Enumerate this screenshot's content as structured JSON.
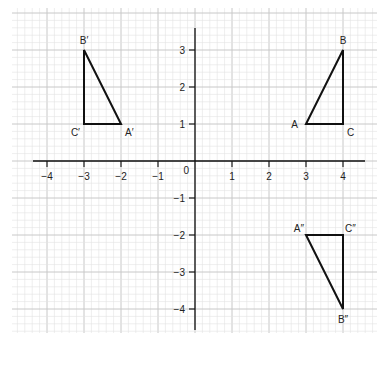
{
  "diagram": {
    "type": "coordinate-grid-transformations",
    "axes": {
      "x_range": [
        -4,
        4
      ],
      "y_range": [
        -4,
        3
      ],
      "x_tick_labels": [
        "−4",
        "−3",
        "−2",
        "−1",
        "1",
        "2",
        "3",
        "4"
      ],
      "x_tick_values": [
        -4,
        -3,
        -2,
        -1,
        1,
        2,
        3,
        4
      ],
      "y_tick_labels": [
        "3",
        "2",
        "1",
        "−1",
        "−2",
        "−3",
        "−4"
      ],
      "y_tick_values": [
        3,
        2,
        1,
        -1,
        -2,
        -3,
        -4
      ],
      "origin_label": "0",
      "grid_minor_per_unit": 5
    },
    "triangles": [
      {
        "name": "ABC",
        "vertices": [
          {
            "label": "A",
            "x": 3,
            "y": 1,
            "label_pos": "left"
          },
          {
            "label": "B",
            "x": 4,
            "y": 3,
            "label_pos": "top"
          },
          {
            "label": "C",
            "x": 4,
            "y": 1,
            "label_pos": "bottom-right"
          }
        ]
      },
      {
        "name": "A'B'C'",
        "vertices": [
          {
            "label": "A′",
            "x": -2,
            "y": 1,
            "label_pos": "bottom-right"
          },
          {
            "label": "B′",
            "x": -3,
            "y": 3,
            "label_pos": "top"
          },
          {
            "label": "C′",
            "x": -3,
            "y": 1,
            "label_pos": "bottom-left"
          }
        ]
      },
      {
        "name": "A''B''C''",
        "vertices": [
          {
            "label": "A″",
            "x": 3,
            "y": -2,
            "label_pos": "top-left"
          },
          {
            "label": "B″",
            "x": 4,
            "y": -4,
            "label_pos": "bottom"
          },
          {
            "label": "C″",
            "x": 4,
            "y": -2,
            "label_pos": "top-right"
          }
        ]
      }
    ],
    "colors": {
      "grid_minor": "#e2e2e2",
      "grid_major": "#c8c8c8",
      "axis": "#111111",
      "shape": "#111111",
      "text": "#222222"
    }
  }
}
